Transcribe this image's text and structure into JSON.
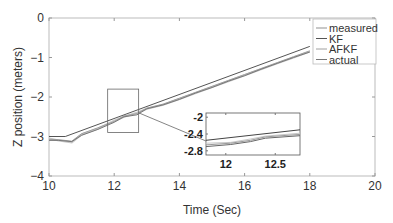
{
  "chart_data": {
    "type": "line",
    "title": "",
    "xlabel": "Time (Sec)",
    "ylabel": "Z position (meters)",
    "xlim": [
      10,
      20
    ],
    "ylim": [
      -4,
      0
    ],
    "xticks": [
      "10",
      "12",
      "14",
      "16",
      "18",
      "20"
    ],
    "yticks": [
      "0",
      "−1",
      "−2",
      "−3",
      "−4"
    ],
    "grid": false,
    "legend_position": "top-right",
    "series": [
      {
        "name": "measured",
        "color": "#c8c8c8",
        "x": [
          10,
          10.3,
          10.7,
          11,
          11.5,
          12,
          12.3,
          12.7,
          13,
          13.5,
          14,
          14.5,
          15,
          15.5,
          16,
          16.5,
          17,
          17.5,
          18
        ],
        "y": [
          -3.05,
          -3.1,
          -3.15,
          -2.95,
          -2.8,
          -2.6,
          -2.5,
          -2.4,
          -2.3,
          -2.2,
          -2.05,
          -1.9,
          -1.75,
          -1.6,
          -1.45,
          -1.3,
          -1.15,
          -1.0,
          -0.85
        ]
      },
      {
        "name": "KF",
        "color": "#555555",
        "x": [
          10,
          10.5,
          18
        ],
        "y": [
          -3.0,
          -3.0,
          -0.72
        ]
      },
      {
        "name": "AFKF",
        "color": "#a0a0a0",
        "x": [
          10,
          10.3,
          10.7,
          11,
          11.5,
          12,
          12.3,
          12.7,
          13,
          13.5,
          14,
          14.5,
          15,
          15.5,
          16,
          16.5,
          17,
          17.5,
          18
        ],
        "y": [
          -3.07,
          -3.08,
          -3.12,
          -2.93,
          -2.78,
          -2.62,
          -2.48,
          -2.42,
          -2.28,
          -2.18,
          -2.03,
          -1.88,
          -1.73,
          -1.58,
          -1.43,
          -1.28,
          -1.13,
          -0.98,
          -0.83
        ]
      },
      {
        "name": "actual",
        "color": "#777777",
        "x": [
          10,
          10.3,
          10.7,
          11,
          11.5,
          12,
          12.3,
          12.7,
          13,
          13.5,
          14,
          14.5,
          15,
          15.5,
          16,
          16.5,
          17,
          17.5,
          18
        ],
        "y": [
          -3.1,
          -3.1,
          -3.13,
          -2.97,
          -2.82,
          -2.64,
          -2.5,
          -2.45,
          -2.3,
          -2.2,
          -2.06,
          -1.9,
          -1.76,
          -1.6,
          -1.46,
          -1.3,
          -1.15,
          -1.0,
          -0.86
        ]
      }
    ],
    "legend": [
      "measured",
      "KF",
      "AFKF",
      "actual"
    ],
    "zoom_region": {
      "xlim": [
        11.8,
        12.75
      ],
      "ylim": [
        -2.9,
        -1.8
      ]
    },
    "inset": {
      "xlim": [
        11.8,
        12.75
      ],
      "ylim": [
        -2.9,
        -1.9
      ],
      "xticks": [
        "12",
        "12.5"
      ],
      "yticks": [
        "-2",
        "-2.4",
        "-2.8"
      ]
    }
  }
}
